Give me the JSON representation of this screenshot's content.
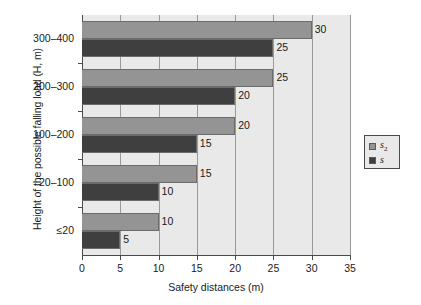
{
  "chart_data": {
    "type": "bar",
    "orientation": "horizontal",
    "title": "",
    "xlabel": "Safety distances (m)",
    "ylabel": "Height of the possible falling load (H, m)",
    "categories": [
      "300–400",
      "200–300",
      "100–200",
      "20–100",
      "≤20"
    ],
    "series": [
      {
        "name": "s2",
        "legend_label": "s",
        "legend_sub": "2",
        "color": "#949494",
        "values": [
          30,
          25,
          20,
          15,
          10
        ]
      },
      {
        "name": "s",
        "legend_label": "s",
        "legend_sub": "",
        "color": "#3f3f3f",
        "values": [
          25,
          20,
          15,
          10,
          5
        ]
      }
    ],
    "xlim": [
      0,
      35
    ],
    "xticks": [
      0,
      5,
      10,
      15,
      20,
      25,
      30,
      35
    ],
    "xtick_labels": [
      "0",
      "5",
      "10",
      "15",
      "20",
      "25",
      "30",
      "35"
    ],
    "grid": "vertical",
    "legend_position": "right-outside",
    "plot_background": "#e9e9e9",
    "page_background": "#ffffff",
    "bar_labels": {
      "s2": [
        "30",
        "25",
        "20",
        "15",
        "10"
      ],
      "s": [
        "25",
        "20",
        "15",
        "10",
        "5"
      ]
    }
  },
  "legend": {
    "entries": [
      {
        "label": "s",
        "sub": "2"
      },
      {
        "label": "s",
        "sub": ""
      }
    ]
  }
}
